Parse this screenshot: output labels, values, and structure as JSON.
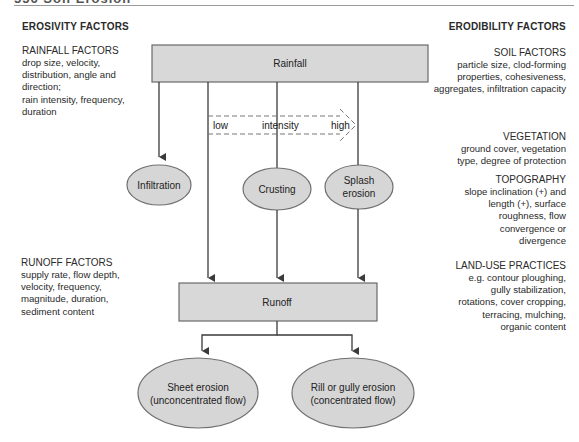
{
  "running_head": "556 Soil Erosion",
  "left": {
    "title": "EROSIVITY FACTORS",
    "rainfall_factors": {
      "heading": "RAINFALL FACTORS",
      "text": "drop size, velocity,\ndistribution, angle and\ndirection;\nrain intensity, frequency,\nduration"
    },
    "runoff_factors": {
      "heading": "RUNOFF FACTORS",
      "text": "supply rate, flow depth,\nvelocity, frequency,\nmagnitude, duration,\nsediment content"
    }
  },
  "right": {
    "title": "ERODIBILITY FACTORS",
    "soil": {
      "heading": "SOIL FACTORS",
      "text": "particle size, clod-forming\nproperties, cohesiveness,\naggregates, infiltration capacity"
    },
    "vegetation": {
      "heading": "VEGETATION",
      "text": "ground cover, vegetation\ntype, degree of protection"
    },
    "topography": {
      "heading": "TOPOGRAPHY",
      "text": "slope inclination (+) and\nlength (+), surface\nroughness, flow\nconvergence or\ndivergence"
    },
    "land_use": {
      "heading": "LAND-USE PRACTICES",
      "text": "e.g. contour ploughing,\ngully stabilization,\nrotations, cover cropping,\nterracing, mulching,\norganic content"
    }
  },
  "diagram": {
    "rainfall": "Rainfall",
    "intensity_arrow": {
      "low": "low",
      "mid": "intensity",
      "high": "high"
    },
    "infiltration": "Infiltration",
    "crusting": "Crusting",
    "splash": [
      "Splash",
      "erosion"
    ],
    "runoff": "Runoff",
    "sheet": [
      "Sheet erosion",
      "(unconcentrated flow)"
    ],
    "rill": [
      "Rill or gully erosion",
      "(concentrated flow)"
    ]
  }
}
